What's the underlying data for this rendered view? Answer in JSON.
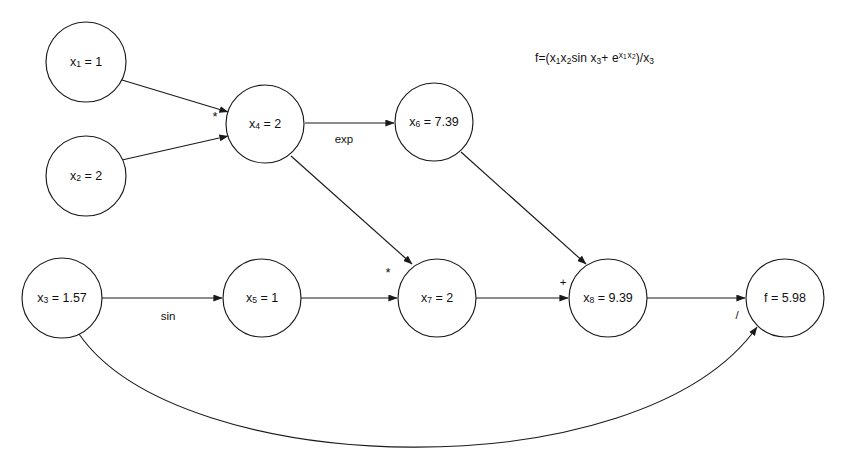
{
  "diagram": {
    "formula": {
      "lhs": "f",
      "eq": "=(",
      "term1_x1": "x",
      "term1_x1_sub": "1",
      "term1_x2": "x",
      "term1_x2_sub": "2",
      "sin_text": "sin x",
      "sin_sub": "3",
      "plus": "+ e",
      "exp_x1": "x",
      "exp_x1_sub": "1",
      "exp_x2": "x",
      "exp_x2_sub": "2",
      "close": ")/x",
      "denom_sub": "3",
      "plain": "f=(x1x2sin x3+e^(x1 x2))/x3"
    },
    "colors": {
      "stroke": "#1a1a1a",
      "text": "#111111",
      "background": "#ffffff"
    },
    "nodes": [
      {
        "id": "x1",
        "var": "x",
        "sub": "1",
        "value": "1",
        "label": "x1 = 1",
        "cx": 86,
        "cy": 62,
        "r": 40
      },
      {
        "id": "x2",
        "var": "x",
        "sub": "2",
        "value": "2",
        "label": "x2 = 2",
        "cx": 86,
        "cy": 176,
        "r": 40
      },
      {
        "id": "x4",
        "var": "x",
        "sub": "4",
        "value": "2",
        "label": "x4 = 2",
        "cx": 265,
        "cy": 124,
        "r": 39
      },
      {
        "id": "x6",
        "var": "x",
        "sub": "6",
        "value": "7.39",
        "label": "x6 = 7.39",
        "cx": 434,
        "cy": 122,
        "r": 39
      },
      {
        "id": "x3",
        "var": "x",
        "sub": "3",
        "value": "1.57",
        "label": "x3 = 1.57",
        "cx": 62,
        "cy": 298,
        "r": 40
      },
      {
        "id": "x5",
        "var": "x",
        "sub": "5",
        "value": "1",
        "label": "x5 = 1",
        "cx": 262,
        "cy": 298,
        "r": 39
      },
      {
        "id": "x7",
        "var": "x",
        "sub": "7",
        "value": "2",
        "label": "x7 = 2",
        "cx": 437,
        "cy": 298,
        "r": 39
      },
      {
        "id": "x8",
        "var": "x",
        "sub": "8",
        "value": "9.39",
        "label": "x8 = 9.39",
        "cx": 608,
        "cy": 298,
        "r": 39
      },
      {
        "id": "f",
        "var": "f",
        "sub": "",
        "value": "5.98",
        "label": "f = 5.98",
        "cx": 785,
        "cy": 298,
        "r": 39
      }
    ],
    "edges": [
      {
        "id": "x1-x4",
        "from": "x1",
        "to": "x4",
        "op": ""
      },
      {
        "id": "x2-x4",
        "from": "x2",
        "to": "x4",
        "op": ""
      },
      {
        "id": "x4-x6",
        "from": "x4",
        "to": "x6",
        "op": "exp"
      },
      {
        "id": "x4-x7",
        "from": "x4",
        "to": "x7",
        "op": ""
      },
      {
        "id": "x6-x8",
        "from": "x6",
        "to": "x8",
        "op": ""
      },
      {
        "id": "x3-x5",
        "from": "x3",
        "to": "x5",
        "op": "sin"
      },
      {
        "id": "x5-x7",
        "from": "x5",
        "to": "x7",
        "op": ""
      },
      {
        "id": "x7-x8",
        "from": "x7",
        "to": "x8",
        "op": ""
      },
      {
        "id": "x8-f",
        "from": "x8",
        "to": "f",
        "op": ""
      },
      {
        "id": "x3-f",
        "from": "x3",
        "to": "f",
        "op": "/"
      }
    ],
    "operators": [
      {
        "id": "mul-x4",
        "symbol": "*",
        "x": 215,
        "y": 118
      },
      {
        "id": "exp-x6",
        "symbol": "exp",
        "x": 344,
        "y": 140
      },
      {
        "id": "mul-x7",
        "symbol": "*",
        "x": 388,
        "y": 274
      },
      {
        "id": "add-x8",
        "symbol": "+",
        "x": 563,
        "y": 283
      },
      {
        "id": "sin-x5",
        "symbol": "sin",
        "x": 168,
        "y": 317
      },
      {
        "id": "div-f",
        "symbol": "/",
        "x": 737,
        "y": 316
      }
    ]
  }
}
